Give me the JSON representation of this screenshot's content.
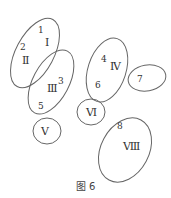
{
  "figure": {
    "caption": "图 6",
    "stroke_color": "#666666",
    "regions": [
      {
        "id": "I-II",
        "numbers": [
          "1",
          "2"
        ],
        "romans": [
          "Ⅰ",
          "Ⅱ"
        ]
      },
      {
        "id": "III",
        "numbers": [
          "3",
          "5"
        ],
        "romans": [
          "Ⅲ"
        ]
      },
      {
        "id": "IV",
        "numbers": [
          "4",
          "6"
        ],
        "romans": [
          "Ⅳ"
        ]
      },
      {
        "id": "7",
        "numbers": [
          "7"
        ],
        "romans": []
      },
      {
        "id": "V",
        "numbers": [],
        "romans": [
          "Ⅴ"
        ]
      },
      {
        "id": "VI",
        "numbers": [],
        "romans": [
          "Ⅵ"
        ]
      },
      {
        "id": "VIII",
        "numbers": [
          "8"
        ],
        "romans": [
          "Ⅷ"
        ]
      }
    ],
    "labels": {
      "n1": "1",
      "r1": "Ⅰ",
      "n2": "2",
      "r2": "Ⅱ",
      "n3": "3",
      "r3": "Ⅲ",
      "n5": "5",
      "n4": "4",
      "r4": "Ⅳ",
      "n6": "6",
      "n7": "7",
      "r5": "Ⅴ",
      "r6": "Ⅵ",
      "n8": "8",
      "r8": "Ⅷ"
    }
  }
}
